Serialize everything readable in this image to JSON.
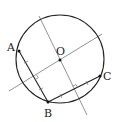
{
  "diagram": {
    "type": "geometry",
    "colors": {
      "circle": "#222222",
      "chord": "#222222",
      "bisector": "#777777",
      "point": "#111111",
      "label": "#222222"
    },
    "circle": {
      "cx": 60,
      "cy": 59,
      "r": 44
    },
    "points": [
      {
        "name": "A",
        "x": 19,
        "y": 51,
        "label_x": 8,
        "label_y": 50
      },
      {
        "name": "B",
        "x": 48,
        "y": 102,
        "label_x": 44,
        "label_y": 117
      },
      {
        "name": "C",
        "x": 100,
        "y": 76,
        "label_x": 104,
        "label_y": 80
      },
      {
        "name": "O",
        "x": 60,
        "y": 60,
        "label_x": 56,
        "label_y": 55
      }
    ],
    "labels": {
      "A": "A",
      "B": "B",
      "C": "C",
      "O": "O"
    },
    "chords": [
      {
        "from": "A",
        "to": "B"
      },
      {
        "from": "B",
        "to": "C"
      }
    ],
    "bisectors": [
      {
        "of": "AB",
        "x1": 9,
        "y1": 91,
        "x2": 102,
        "y2": 34
      },
      {
        "of": "BC",
        "x1": 39,
        "y1": 16,
        "x2": 87,
        "y2": 115
      }
    ]
  }
}
